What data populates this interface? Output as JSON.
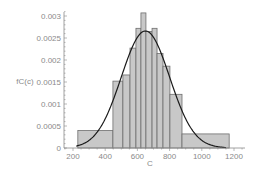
{
  "chart_data": {
    "type": "bar",
    "subtype": "histogram-with-density-curve",
    "title": "",
    "xlabel": "C",
    "ylabel": "fC(c)",
    "xlim": [
      200,
      1250
    ],
    "ylim": [
      0,
      0.0031
    ],
    "grid": false,
    "legend": null,
    "x_ticks": [
      200,
      400,
      600,
      800,
      1000,
      1200
    ],
    "x_tick_labels": [
      "200",
      "400",
      "600",
      "800",
      "1000",
      "1200"
    ],
    "y_ticks": [
      0,
      0.0005,
      0.001,
      0.0015,
      0.002,
      0.0025,
      0.003
    ],
    "y_tick_labels": [
      "0",
      "0.0005",
      "0.001",
      "0.0015",
      "0.002",
      "0.0025",
      "0.003"
    ],
    "histogram": {
      "bins": [
        {
          "left": 230,
          "right": 448,
          "density": 0.0004
        },
        {
          "left": 448,
          "right": 510,
          "density": 0.00152
        },
        {
          "left": 510,
          "right": 554,
          "density": 0.00166
        },
        {
          "left": 554,
          "right": 591,
          "density": 0.00227
        },
        {
          "left": 591,
          "right": 622,
          "density": 0.00272
        },
        {
          "left": 622,
          "right": 653,
          "density": 0.00307
        },
        {
          "left": 653,
          "right": 691,
          "density": 0.00265
        },
        {
          "left": 691,
          "right": 722,
          "density": 0.00272
        },
        {
          "left": 722,
          "right": 759,
          "density": 0.00215
        },
        {
          "left": 759,
          "right": 802,
          "density": 0.00186
        },
        {
          "left": 802,
          "right": 877,
          "density": 0.00122
        },
        {
          "left": 877,
          "right": 1170,
          "density": 0.00032
        }
      ],
      "fill_color": "#c8c8c8",
      "edge_color": "#6e6e6e"
    },
    "series": [
      {
        "name": "normal density fit",
        "type": "line",
        "distribution": "normal",
        "mean": 650,
        "std": 150,
        "x_range": [
          220,
          1150
        ],
        "color": "#1a1a1a"
      }
    ]
  },
  "labels": {
    "ylabel": "fC(c)",
    "xlabel": "C"
  },
  "colors": {
    "axis": "#8a8a8a",
    "bar_fill": "#c8c8c8",
    "bar_edge": "#6e6e6e",
    "curve": "#1a1a1a"
  }
}
